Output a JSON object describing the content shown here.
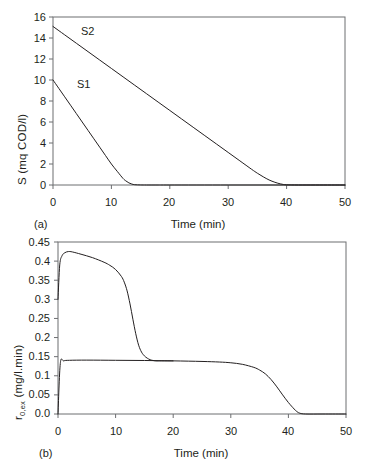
{
  "figure": {
    "panels": [
      {
        "tag": "(a)",
        "xlabel": "Time (min)",
        "ylabel_main": "S (mq COD/l)",
        "xticks": [
          "0",
          "10",
          "20",
          "30",
          "40",
          "50"
        ],
        "yticks": [
          "0",
          "2",
          "4",
          "6",
          "8",
          "10",
          "12",
          "14",
          "16"
        ],
        "series_labels": [
          "S2",
          "S1"
        ]
      },
      {
        "tag": "(b)",
        "xlabel": "Time (min)",
        "ylabel_prefix": "r",
        "ylabel_sub": "0,ex",
        "ylabel_suffix": " (mg/l.min)",
        "xticks": [
          "0",
          "10",
          "20",
          "30",
          "40",
          "50"
        ],
        "yticks": [
          "0.0",
          "0.05",
          "0.1",
          "0.15",
          "0.2",
          "0.25",
          "0.3",
          "0.35",
          "0.4",
          "0.45"
        ]
      }
    ],
    "line_color": "#231f20",
    "axis_color": "#6d6e71"
  },
  "chart_data": [
    {
      "type": "line",
      "panel": "(a)",
      "title": "",
      "xlabel": "Time (min)",
      "ylabel": "S (mq COD/l)",
      "xlim": [
        0,
        50
      ],
      "ylim": [
        0,
        16
      ],
      "xticks": [
        0,
        10,
        20,
        30,
        40,
        50
      ],
      "yticks": [
        0,
        2,
        4,
        6,
        8,
        10,
        12,
        14,
        16
      ],
      "grid": false,
      "legend": "inline-annotations",
      "series": [
        {
          "name": "S2",
          "label_position": {
            "x": 5.2,
            "y": 15.1
          },
          "x": [
            0,
            2,
            4,
            6,
            8,
            10,
            12,
            14,
            16,
            18,
            20,
            22,
            24,
            26,
            28,
            30,
            32,
            34,
            35,
            36,
            37,
            38,
            39,
            40,
            42,
            45,
            50
          ],
          "y": [
            15.1,
            14.3,
            13.5,
            12.7,
            11.9,
            11.1,
            10.3,
            9.5,
            8.7,
            7.9,
            7.1,
            6.3,
            5.5,
            4.7,
            3.9,
            3.1,
            2.3,
            1.5,
            1.12,
            0.78,
            0.48,
            0.26,
            0.1,
            0.02,
            0,
            0,
            0
          ]
        },
        {
          "name": "S1",
          "label_position": {
            "x": 4.6,
            "y": 9.6
          },
          "x": [
            0,
            1,
            2,
            3,
            4,
            5,
            6,
            7,
            8,
            9,
            10,
            11,
            12,
            12.5,
            13,
            13.5,
            14,
            15,
            16,
            18,
            20,
            30,
            40,
            50
          ],
          "y": [
            10.0,
            9.2,
            8.4,
            7.6,
            6.8,
            6.0,
            5.2,
            4.4,
            3.6,
            2.8,
            2.0,
            1.3,
            0.62,
            0.38,
            0.2,
            0.09,
            0.03,
            0.005,
            0,
            0,
            0,
            0,
            0,
            0
          ]
        }
      ]
    },
    {
      "type": "line",
      "panel": "(b)",
      "title": "",
      "xlabel": "Time (min)",
      "ylabel": "r0,ex (mg/l.min)",
      "xlim": [
        0,
        50
      ],
      "ylim": [
        0,
        0.45
      ],
      "xticks": [
        0,
        10,
        20,
        30,
        40,
        50
      ],
      "yticks": [
        0,
        0.05,
        0.1,
        0.15,
        0.2,
        0.25,
        0.3,
        0.35,
        0.4,
        0.45
      ],
      "grid": false,
      "legend": "none",
      "series": [
        {
          "name": "upper-curve",
          "x": [
            0,
            0.3,
            0.7,
            1.2,
            1.8,
            2.5,
            4,
            6,
            8,
            9,
            10,
            11,
            11.5,
            12,
            12.5,
            13,
            13.5,
            14,
            14.5,
            15,
            15.5,
            16,
            16.5,
            17,
            18,
            20
          ],
          "y": [
            0.3,
            0.39,
            0.414,
            0.422,
            0.425,
            0.424,
            0.418,
            0.409,
            0.397,
            0.389,
            0.378,
            0.36,
            0.345,
            0.322,
            0.288,
            0.248,
            0.21,
            0.18,
            0.162,
            0.152,
            0.146,
            0.142,
            0.14,
            0.139,
            0.139,
            0.139
          ]
        },
        {
          "name": "lower-curve",
          "x": [
            0,
            0.4,
            1,
            2,
            5,
            10,
            15,
            20,
            25,
            28,
            30,
            32,
            34,
            35,
            36,
            37,
            38,
            39,
            40,
            41,
            41.5,
            42,
            43,
            46,
            50
          ],
          "y": [
            0.0,
            0.132,
            0.139,
            0.1405,
            0.141,
            0.1405,
            0.14,
            0.139,
            0.1375,
            0.136,
            0.134,
            0.13,
            0.122,
            0.115,
            0.105,
            0.09,
            0.071,
            0.05,
            0.03,
            0.013,
            0.006,
            0.002,
            0,
            0,
            0
          ]
        }
      ]
    }
  ]
}
